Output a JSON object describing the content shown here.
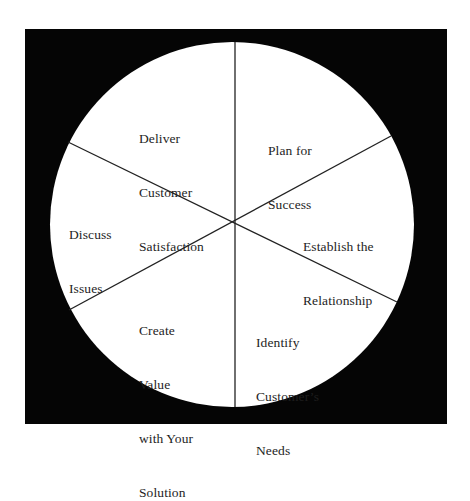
{
  "diagram": {
    "type": "cycle-wheel",
    "segment_count": 6,
    "colors": {
      "background": "#ffffff",
      "frame": "#050505",
      "circle_fill": "#ffffff",
      "divider": "#222222",
      "text": "#1e1e1e"
    },
    "segments": [
      {
        "id": "plan",
        "position": "top-right",
        "lines": [
          "Plan for",
          "Success"
        ]
      },
      {
        "id": "establish",
        "position": "right",
        "lines": [
          "Establish the",
          "Relationship"
        ]
      },
      {
        "id": "identify",
        "position": "bottom-right",
        "lines": [
          "Identify",
          "Customer’s",
          "Needs"
        ]
      },
      {
        "id": "create",
        "position": "bottom-left",
        "lines": [
          "Create",
          "Value",
          "with Your",
          "Solution"
        ]
      },
      {
        "id": "discuss",
        "position": "left",
        "lines": [
          "Discuss",
          "Issues"
        ]
      },
      {
        "id": "deliver",
        "position": "top-left",
        "lines": [
          "Deliver",
          "Customer",
          "Satisfaction"
        ]
      }
    ]
  }
}
